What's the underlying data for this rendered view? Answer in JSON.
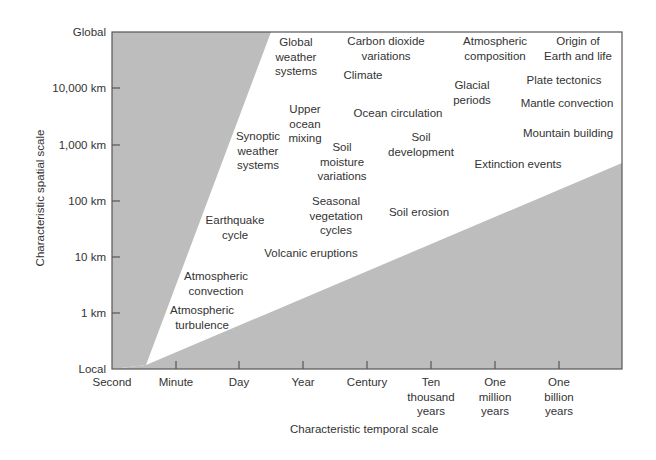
{
  "chart_data": {
    "type": "diagram",
    "title": "",
    "xlabel": "Characteristic temporal scale",
    "ylabel": "Characteristic spatial scale",
    "x_ticks": [
      "Second",
      "Minute",
      "Day",
      "Year",
      "Century",
      "Ten\nthousand\nyears",
      "One\nmillion\nyears",
      "One\nbillion\nyears"
    ],
    "y_ticks": [
      "Local",
      "1 km",
      "10 km",
      "100 km",
      "1,000 km",
      "10,000 km",
      "Global"
    ],
    "regions": {
      "shaded_color": "#bdbdbd",
      "description": "Two gray shaded wedges (upper-left and lower-right) bound a white diagonal band in which phenomena are labeled"
    },
    "phenomena": [
      {
        "label": "Global\nweather\nsystems",
        "cx": 296,
        "top": 35
      },
      {
        "label": "Carbon dioxide\nvariations",
        "cx": 386,
        "top": 34
      },
      {
        "label": "Atmospheric\ncomposition",
        "cx": 495,
        "top": 34
      },
      {
        "label": "Origin of\nEarth and life",
        "cx": 578,
        "top": 34
      },
      {
        "label": "Climate",
        "cx": 363,
        "top": 68
      },
      {
        "label": "Plate tectonics",
        "cx": 564,
        "top": 73
      },
      {
        "label": "Glacial\nperiods",
        "cx": 472,
        "top": 78
      },
      {
        "label": "Mantle convection",
        "cx": 567,
        "top": 96
      },
      {
        "label": "Upper\nocean\nmixing",
        "cx": 305,
        "top": 102
      },
      {
        "label": "Ocean circulation",
        "cx": 398,
        "top": 106
      },
      {
        "label": "Mountain building",
        "cx": 568,
        "top": 126
      },
      {
        "label": "Synoptic\nweather\nsystems",
        "cx": 258,
        "top": 129
      },
      {
        "label": "Soil\ndevelopment",
        "cx": 421,
        "top": 130
      },
      {
        "label": "Soil\nmoisture\nvariations",
        "cx": 342,
        "top": 140
      },
      {
        "label": "Extinction events",
        "cx": 518,
        "top": 157
      },
      {
        "label": "Seasonal\nvegetation\ncycles",
        "cx": 336,
        "top": 194
      },
      {
        "label": "Soil erosion",
        "cx": 419,
        "top": 205
      },
      {
        "label": "Earthquake\ncycle",
        "cx": 235,
        "top": 213
      },
      {
        "label": "Volcanic eruptions",
        "cx": 311,
        "top": 246
      },
      {
        "label": "Atmospheric\nconvection",
        "cx": 216,
        "top": 269
      },
      {
        "label": "Atmospheric\nturbulence",
        "cx": 202,
        "top": 303
      }
    ]
  },
  "axes": {
    "y_title": "Characteristic spatial scale",
    "x_title": "Characteristic temporal scale",
    "y_ticks": [
      {
        "label": "Global",
        "y": 32
      },
      {
        "label": "10,000 km",
        "y": 88
      },
      {
        "label": "1,000 km",
        "y": 145
      },
      {
        "label": "100 km",
        "y": 201
      },
      {
        "label": "10 km",
        "y": 257
      },
      {
        "label": "1 km",
        "y": 313
      },
      {
        "label": "Local",
        "y": 369
      }
    ],
    "x_ticks": [
      {
        "label": "Second",
        "x": 112
      },
      {
        "label": "Minute",
        "x": 176
      },
      {
        "label": "Day",
        "x": 239
      },
      {
        "label": "Year",
        "x": 303
      },
      {
        "label": "Century",
        "x": 367
      },
      {
        "label": "Ten\nthousand\nyears",
        "x": 431
      },
      {
        "label": "One\nmillion\nyears",
        "x": 495
      },
      {
        "label": "One\nbillion\nyears",
        "x": 559
      }
    ]
  },
  "colors": {
    "shade": "#bdbdbd",
    "frame": "#555555",
    "text": "#333333"
  }
}
